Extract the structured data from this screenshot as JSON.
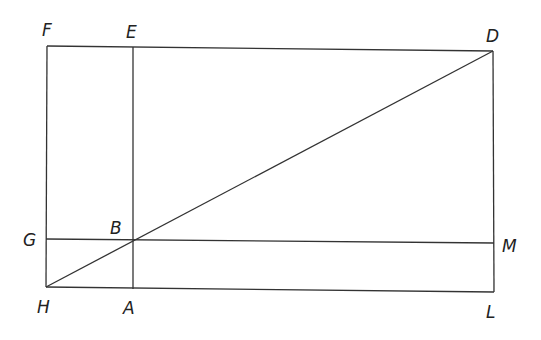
{
  "diagram": {
    "type": "geometric-rectangle-with-diagonal",
    "points": {
      "F": {
        "x": 47,
        "y": 46
      },
      "E": {
        "x": 133,
        "y": 47
      },
      "D": {
        "x": 493,
        "y": 51
      },
      "G": {
        "x": 46,
        "y": 239
      },
      "B": {
        "x": 133,
        "y": 241
      },
      "M": {
        "x": 494,
        "y": 243
      },
      "H": {
        "x": 46,
        "y": 287
      },
      "A": {
        "x": 133,
        "y": 289
      },
      "L": {
        "x": 494,
        "y": 292
      }
    },
    "labels": {
      "F": {
        "text": "F",
        "x": 42,
        "y": 36
      },
      "E": {
        "text": "E",
        "x": 126,
        "y": 38
      },
      "D": {
        "text": "D",
        "x": 486,
        "y": 42
      },
      "G": {
        "text": "G",
        "x": 23,
        "y": 246
      },
      "B": {
        "text": "B",
        "x": 110,
        "y": 234
      },
      "M": {
        "text": "M",
        "x": 502,
        "y": 252
      },
      "H": {
        "text": "H",
        "x": 37,
        "y": 313
      },
      "A": {
        "text": "A",
        "x": 123,
        "y": 314
      },
      "L": {
        "text": "L",
        "x": 486,
        "y": 318
      }
    },
    "segments": [
      "F-D",
      "H-L",
      "F-H",
      "D-L",
      "E-A",
      "G-M",
      "H-D"
    ]
  }
}
